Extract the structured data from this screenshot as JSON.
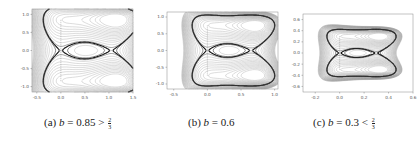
{
  "figure": {
    "panels": [
      {
        "id": "a",
        "caption_prefix": "(a) ",
        "caption_var": "b",
        "caption_rel": " = 0.85 > ",
        "caption_frac_num": "2",
        "caption_frac_den": "3",
        "caption_text": "(a) b = 0.85 > 2/3"
      },
      {
        "id": "b",
        "caption_prefix": "(b) ",
        "caption_var": "b",
        "caption_rel": " = 0.6",
        "caption_frac_num": "",
        "caption_frac_den": "",
        "caption_text": "(b) b = 0.6"
      },
      {
        "id": "c",
        "caption_prefix": "(c) ",
        "caption_var": "b",
        "caption_rel": " = 0.3 < ",
        "caption_frac_num": "2",
        "caption_frac_den": "3",
        "caption_text": "(c) b = 0.3 < 2/3"
      }
    ]
  },
  "chart_data": [
    {
      "type": "contour",
      "title": "(a) b = 0.85 > 2/3",
      "xlabel": "",
      "ylabel": "",
      "xlim": [
        -0.6,
        1.5
      ],
      "ylim": [
        -1.15,
        1.15
      ],
      "xticks": [
        "-0.5",
        "0.0",
        "0.5",
        "1.0",
        "1.5"
      ],
      "yticks": [
        "1.0",
        "0.5",
        "0.0",
        "-0.5",
        "-1.0"
      ],
      "grid": false,
      "features": {
        "saddle_points": [
          [
            0.0,
            0.0
          ],
          [
            1.0,
            0.7
          ],
          [
            1.0,
            -0.7
          ]
        ],
        "centers": [
          [
            0.0,
            0.85
          ],
          [
            0.0,
            -0.85
          ],
          [
            1.05,
            0.0
          ]
        ],
        "separatrix": "thick dark curves forming figure-eight loops around centers"
      }
    },
    {
      "type": "contour",
      "title": "(b) b = 0.6",
      "xlabel": "",
      "ylabel": "",
      "xlim": [
        -0.6,
        1.05
      ],
      "ylim": [
        -1.15,
        1.15
      ],
      "xticks": [
        "-0.5",
        "0.0",
        "0.5",
        "1.0"
      ],
      "yticks": [
        "1.0",
        "0.5",
        "0.0",
        "-0.5",
        "-1.0"
      ],
      "grid": false,
      "features": {
        "saddle_points": [
          [
            0.0,
            0.0
          ],
          [
            0.6,
            0.7
          ],
          [
            0.6,
            -0.7
          ]
        ],
        "centers": [
          [
            0.0,
            0.75
          ],
          [
            0.0,
            -0.75
          ],
          [
            0.65,
            0.0
          ]
        ],
        "separatrix": "thick dark curves crossing in an X pattern"
      }
    },
    {
      "type": "contour",
      "title": "(c) b = 0.3 < 2/3",
      "xlabel": "",
      "ylabel": "",
      "xlim": [
        -0.3,
        0.6
      ],
      "ylim": [
        -0.7,
        0.7
      ],
      "xticks": [
        "-0.2",
        "0.0",
        "0.2",
        "0.4",
        "0.6"
      ],
      "yticks": [
        "0.6",
        "0.4",
        "0.2",
        "0.0",
        "-0.2",
        "-0.4",
        "-0.6"
      ],
      "grid": false,
      "features": {
        "saddle_points": [
          [
            0.0,
            0.0
          ],
          [
            0.3,
            0.3
          ],
          [
            0.3,
            -0.3
          ]
        ],
        "centers": [
          [
            0.0,
            0.3
          ],
          [
            0.0,
            -0.3
          ],
          [
            0.3,
            0.0
          ]
        ],
        "separatrix": "thick dark curves enclosing three cells"
      }
    }
  ]
}
